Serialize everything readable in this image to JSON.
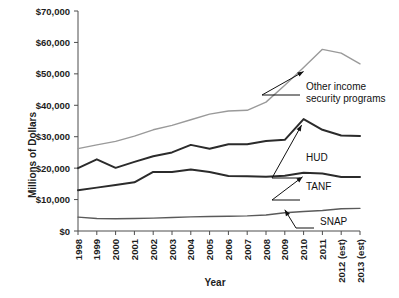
{
  "chart_data": {
    "type": "line",
    "title": "",
    "xlabel": "Year",
    "ylabel": "Millions of Dollars",
    "grid": false,
    "legend_position": "inline-annotations",
    "ylim": [
      0,
      70000
    ],
    "ytick_labels": [
      "$70,000",
      "$60,000",
      "$50,000",
      "$40,000",
      "$30,000",
      "$20,000",
      "$10,000",
      "$0"
    ],
    "ytick_values": [
      70000,
      60000,
      50000,
      40000,
      30000,
      20000,
      10000,
      0
    ],
    "categories": [
      "1998",
      "1999",
      "2000",
      "2001",
      "2002",
      "2003",
      "2004",
      "2005",
      "2006",
      "2007",
      "2008",
      "2009",
      "2010",
      "2011",
      "2012 (est)",
      "2013 (est)"
    ],
    "series": [
      {
        "name": "Other income security programs",
        "color": "#9a9a9a",
        "width": 1.4,
        "values": [
          26200,
          27400,
          28500,
          30200,
          32200,
          33600,
          35400,
          37200,
          38200,
          38400,
          41000,
          46400,
          52000,
          57800,
          56600,
          53200
        ]
      },
      {
        "name": "HUD",
        "color": "#2b2b2b",
        "width": 2.0,
        "values": [
          20000,
          22800,
          20100,
          22000,
          23800,
          25000,
          27400,
          26200,
          27600,
          27600,
          28600,
          29000,
          35600,
          32200,
          30400,
          30200
        ]
      },
      {
        "name": "TANF",
        "color": "#2b2b2b",
        "width": 2.0,
        "values": [
          13000,
          13800,
          14600,
          15500,
          18800,
          18800,
          19600,
          18800,
          17500,
          17400,
          17300,
          17600,
          18500,
          18300,
          17200,
          17200
        ]
      },
      {
        "name": "SNAP",
        "color": "#5a5a5a",
        "width": 1.4,
        "values": [
          4400,
          4000,
          3900,
          4000,
          4100,
          4300,
          4500,
          4600,
          4700,
          4800,
          5100,
          5800,
          6200,
          6500,
          7100,
          7200
        ]
      }
    ],
    "annotations": [
      {
        "name": "other-income-security-programs",
        "label_line_1": "Other income",
        "label_line_2": "security programs"
      },
      {
        "name": "hud",
        "label_line_1": "HUD",
        "label_line_2": ""
      },
      {
        "name": "tanf",
        "label_line_1": "TANF",
        "label_line_2": ""
      },
      {
        "name": "snap",
        "label_line_1": "SNAP",
        "label_line_2": ""
      }
    ]
  }
}
